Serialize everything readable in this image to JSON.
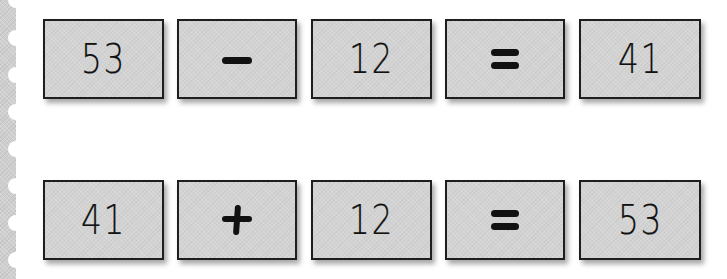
{
  "colors": {
    "tile_fill": "#d3d3d3",
    "tile_border": "#1e1e1e",
    "stamp_edge": "#cfcfcf",
    "background": "#ffffff",
    "ink": "#111111"
  },
  "equations": [
    {
      "label": "subtraction",
      "tiles": [
        {
          "kind": "number",
          "text": "53"
        },
        {
          "kind": "operator",
          "text": "−",
          "icon": "minus-icon"
        },
        {
          "kind": "number",
          "text": "12"
        },
        {
          "kind": "operator",
          "text": "=",
          "icon": "equals-icon"
        },
        {
          "kind": "number",
          "text": "41"
        }
      ]
    },
    {
      "label": "addition",
      "tiles": [
        {
          "kind": "number",
          "text": "41"
        },
        {
          "kind": "operator",
          "text": "+",
          "icon": "plus-icon"
        },
        {
          "kind": "number",
          "text": "12"
        },
        {
          "kind": "operator",
          "text": "=",
          "icon": "equals-icon"
        },
        {
          "kind": "number",
          "text": "53"
        }
      ]
    }
  ]
}
